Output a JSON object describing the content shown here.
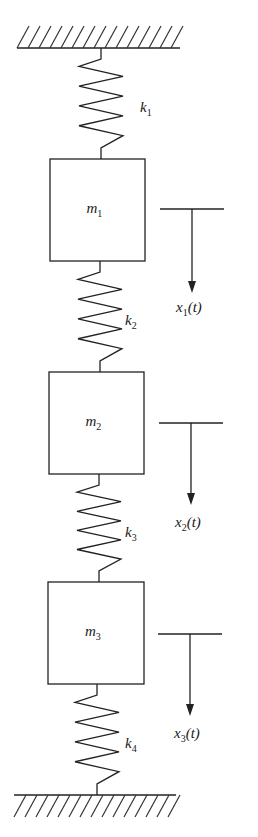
{
  "diagram": {
    "colors": {
      "line": "#222222",
      "text": "#1a1a1a",
      "background": "#ffffff"
    },
    "supports": [
      {
        "name": "top-wall",
        "y": 48,
        "x1": 17,
        "x2": 180,
        "hatch_side": "above"
      },
      {
        "name": "bottom-wall",
        "y": 795,
        "x1": 14,
        "x2": 176,
        "hatch_side": "below"
      }
    ],
    "springs": [
      {
        "id": "k1",
        "label": "k",
        "sub": "1",
        "x": 101,
        "y_top": 48,
        "y_bottom": 159,
        "label_x": 140,
        "label_y": 112
      },
      {
        "id": "k2",
        "label": "k",
        "sub": "2",
        "x": 100,
        "y_top": 261,
        "y_bottom": 372,
        "label_x": 125,
        "label_y": 325
      },
      {
        "id": "k3",
        "label": "k",
        "sub": "3",
        "x": 99,
        "y_top": 474,
        "y_bottom": 582,
        "label_x": 125,
        "label_y": 537
      },
      {
        "id": "k4",
        "label": "k",
        "sub": "4",
        "x": 97,
        "y_top": 684,
        "y_bottom": 795,
        "label_x": 125,
        "label_y": 748
      }
    ],
    "masses": [
      {
        "id": "m1",
        "label": "m",
        "sub": "1",
        "x": 50,
        "y": 159,
        "w": 95,
        "h": 102
      },
      {
        "id": "m2",
        "label": "m",
        "sub": "2",
        "x": 49,
        "y": 372,
        "w": 95,
        "h": 102
      },
      {
        "id": "m3",
        "label": "m",
        "sub": "3",
        "x": 48,
        "y": 582,
        "w": 96,
        "h": 102
      }
    ],
    "displacements": [
      {
        "id": "x1",
        "label": "x",
        "sub": "1",
        "arg": "(t)",
        "ref_y": 209,
        "x1": 160,
        "x2": 224,
        "arrow_x": 192,
        "tip_y": 293,
        "label_y": 312
      },
      {
        "id": "x2",
        "label": "x",
        "sub": "2",
        "arg": "(t)",
        "ref_y": 423,
        "x1": 159,
        "x2": 223,
        "arrow_x": 191,
        "tip_y": 505,
        "label_y": 527
      },
      {
        "id": "x3",
        "label": "x",
        "sub": "3",
        "arg": "(t)",
        "ref_y": 634,
        "x1": 158,
        "x2": 222,
        "arrow_x": 190,
        "tip_y": 716,
        "label_y": 738
      }
    ]
  }
}
